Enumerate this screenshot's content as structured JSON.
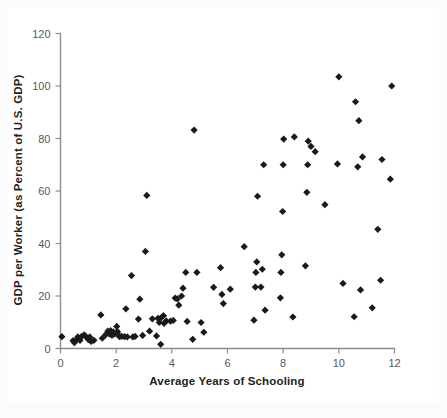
{
  "figure": {
    "background_color": "#ffffff",
    "page_tint": "#fbfbfb",
    "marker_color": "#1a1a1a",
    "axis_color": "#8d8d8d",
    "text_color": "#231f20"
  },
  "chart_data": {
    "type": "scatter",
    "title": "",
    "xlabel": "Average Years of Schooling",
    "ylabel": "GDP per Worker (as Percent of U.S. GDP)",
    "xlim": [
      0,
      12
    ],
    "ylim": [
      0,
      120
    ],
    "xticks": [
      0,
      2,
      4,
      6,
      8,
      10,
      12
    ],
    "xtick_labels": [
      "0",
      "2",
      "4",
      "6",
      "8",
      "10",
      "12"
    ],
    "yticks": [
      0,
      20,
      40,
      60,
      80,
      100,
      120
    ],
    "ytick_labels": [
      "0",
      "20",
      "40",
      "60",
      "80",
      "100",
      "120"
    ],
    "grid": false,
    "legend": null,
    "marker_shape": "diamond",
    "marker_size_px": 6,
    "n_points": 99,
    "points": [
      [
        0.05,
        4.5
      ],
      [
        0.45,
        3.0
      ],
      [
        0.5,
        2.2
      ],
      [
        0.6,
        3.6
      ],
      [
        0.62,
        4.4
      ],
      [
        0.7,
        3.1
      ],
      [
        0.75,
        4.5
      ],
      [
        0.85,
        5.2
      ],
      [
        0.9,
        4.6
      ],
      [
        1.0,
        3.4
      ],
      [
        1.05,
        4.4
      ],
      [
        1.1,
        2.7
      ],
      [
        1.2,
        3.1
      ],
      [
        1.45,
        12.8
      ],
      [
        1.5,
        3.9
      ],
      [
        1.62,
        5.2
      ],
      [
        1.7,
        6.6
      ],
      [
        1.75,
        5.6
      ],
      [
        1.8,
        6.8
      ],
      [
        1.85,
        5.0
      ],
      [
        1.9,
        6.3
      ],
      [
        1.95,
        5.6
      ],
      [
        2.0,
        6.0
      ],
      [
        2.02,
        8.4
      ],
      [
        2.05,
        6.4
      ],
      [
        2.1,
        5.0
      ],
      [
        2.12,
        4.5
      ],
      [
        2.2,
        4.6
      ],
      [
        2.3,
        4.5
      ],
      [
        2.35,
        15.1
      ],
      [
        2.4,
        4.4
      ],
      [
        2.55,
        27.8
      ],
      [
        2.6,
        4.4
      ],
      [
        2.68,
        4.6
      ],
      [
        2.8,
        11.2
      ],
      [
        2.85,
        18.8
      ],
      [
        2.95,
        5.0
      ],
      [
        3.05,
        37.0
      ],
      [
        3.1,
        58.3
      ],
      [
        3.2,
        6.6
      ],
      [
        3.3,
        11.3
      ],
      [
        3.45,
        4.8
      ],
      [
        3.5,
        11.5
      ],
      [
        3.55,
        9.9
      ],
      [
        3.6,
        1.6
      ],
      [
        3.62,
        11.8
      ],
      [
        3.7,
        12.5
      ],
      [
        3.72,
        9.6
      ],
      [
        3.8,
        10.5
      ],
      [
        3.95,
        10.4
      ],
      [
        4.05,
        10.7
      ],
      [
        4.12,
        19.2
      ],
      [
        4.2,
        18.9
      ],
      [
        4.25,
        16.5
      ],
      [
        4.35,
        20.0
      ],
      [
        4.4,
        23.0
      ],
      [
        4.5,
        29.0
      ],
      [
        4.55,
        10.3
      ],
      [
        4.75,
        3.5
      ],
      [
        4.8,
        83.2
      ],
      [
        4.9,
        29.0
      ],
      [
        5.05,
        9.9
      ],
      [
        5.15,
        6.2
      ],
      [
        5.5,
        23.3
      ],
      [
        5.75,
        30.8
      ],
      [
        5.8,
        20.6
      ],
      [
        5.85,
        17.1
      ],
      [
        6.1,
        22.6
      ],
      [
        6.6,
        38.8
      ],
      [
        6.95,
        10.8
      ],
      [
        7.0,
        23.4
      ],
      [
        7.02,
        29.0
      ],
      [
        7.05,
        33.0
      ],
      [
        7.08,
        58.0
      ],
      [
        7.2,
        23.4
      ],
      [
        7.25,
        30.2
      ],
      [
        7.3,
        70.0
      ],
      [
        7.35,
        14.6
      ],
      [
        7.9,
        19.3
      ],
      [
        7.92,
        29.0
      ],
      [
        7.95,
        35.7
      ],
      [
        7.98,
        52.2
      ],
      [
        8.0,
        70.0
      ],
      [
        8.02,
        79.8
      ],
      [
        8.35,
        12.0
      ],
      [
        8.4,
        80.6
      ],
      [
        8.8,
        31.5
      ],
      [
        8.85,
        59.5
      ],
      [
        8.88,
        70.0
      ],
      [
        8.9,
        79.0
      ],
      [
        9.0,
        77.0
      ],
      [
        9.15,
        75.0
      ],
      [
        9.5,
        54.8
      ],
      [
        9.95,
        70.3
      ],
      [
        10.0,
        103.5
      ],
      [
        10.15,
        24.8
      ],
      [
        10.55,
        12.1
      ],
      [
        10.6,
        94.0
      ],
      [
        10.68,
        69.2
      ],
      [
        10.72,
        86.8
      ],
      [
        10.78,
        22.3
      ],
      [
        10.85,
        73.0
      ],
      [
        11.2,
        15.5
      ],
      [
        11.4,
        45.4
      ],
      [
        11.5,
        26.0
      ],
      [
        11.55,
        72.0
      ],
      [
        11.85,
        64.5
      ],
      [
        11.9,
        100.0
      ]
    ]
  }
}
